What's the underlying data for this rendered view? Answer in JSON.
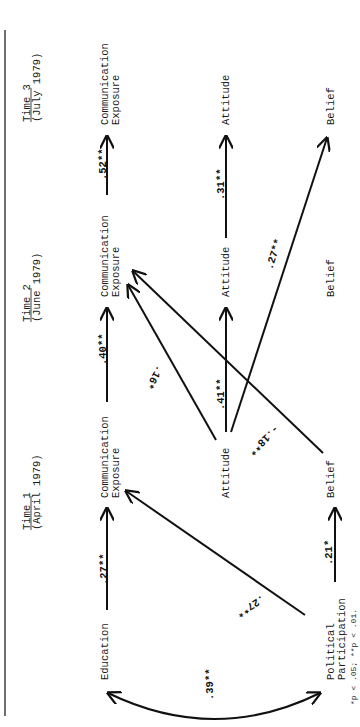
{
  "time_periods": [
    {
      "title": "Time 1",
      "date": "(April 1979)"
    },
    {
      "title": "Time 2",
      "date": "(June 1979)"
    },
    {
      "title": "Time 3",
      "date": "(July 1979)"
    }
  ],
  "nodes": {
    "education": "Education",
    "political_participation": [
      "Political",
      "Participation"
    ],
    "comm_exposure": [
      "Communication",
      "Exposure"
    ],
    "attitude": "Attitude",
    "belief": "Belief"
  },
  "paths": [
    {
      "from": "Education",
      "to": "Communication Exposure T1",
      "coef": ".27**"
    },
    {
      "from": "Political Participation",
      "to": "Belief T1",
      "coef": ".21*"
    },
    {
      "from": "Political Participation",
      "to": "Communication Exposure T1",
      "coef": ".27**"
    },
    {
      "from": "Education",
      "to": "Political Participation",
      "coef": ".39**",
      "type": "correlation"
    },
    {
      "from": "Communication Exposure T1",
      "to": "Communication Exposure T2",
      "coef": ".40**"
    },
    {
      "from": "Attitude T1",
      "to": "Attitude T2",
      "coef": ".41**"
    },
    {
      "from": "Attitude T1",
      "to": "Communication Exposure T2",
      "coef": ".16*"
    },
    {
      "from": "Belief T1",
      "to": "Communication Exposure T2",
      "coef": "-.18**"
    },
    {
      "from": "Attitude T1",
      "to": "Belief T3",
      "coef": ".27**"
    },
    {
      "from": "Communication Exposure T2",
      "to": "Communication Exposure T3",
      "coef": ".52**"
    },
    {
      "from": "Attitude T2",
      "to": "Attitude T3",
      "coef": ".31**"
    }
  ],
  "footnote": "*p < .05; **p < .01."
}
